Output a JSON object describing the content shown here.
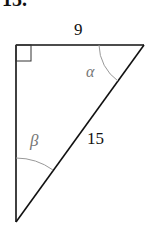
{
  "problem_number": "15.",
  "triangle": {
    "type": "right-triangle",
    "right_angle_vertex": "top-left",
    "sides": {
      "top_leg": "9",
      "hypotenuse": "15"
    },
    "angles": {
      "top_right": "α",
      "bottom": "β"
    }
  }
}
